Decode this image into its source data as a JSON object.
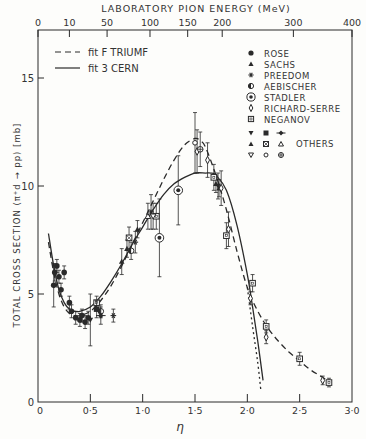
{
  "chart_data": {
    "type": "scatter",
    "title": "",
    "top_axis": {
      "label": "LABORATORY PION ENERGY (MeV)",
      "ticks": [
        {
          "label": "0",
          "eta": 0.0
        },
        {
          "label": "10",
          "eta": 0.3
        },
        {
          "label": "50",
          "eta": 0.66
        },
        {
          "label": "100",
          "eta": 1.07
        },
        {
          "label": "150",
          "eta": 1.43
        },
        {
          "label": "200",
          "eta": 1.76
        },
        {
          "label": "300",
          "eta": 2.44
        },
        {
          "label": "400",
          "eta": 3.0
        }
      ]
    },
    "xlabel": "η",
    "ylabel": "TOTAL CROSS SECTION (π⁺d → pp) [mb]",
    "xlim": [
      0,
      3.0
    ],
    "ylim": [
      0,
      17
    ],
    "xticks": [
      {
        "v": 0,
        "label": "0"
      },
      {
        "v": 0.5,
        "label": "0·5"
      },
      {
        "v": 1.0,
        "label": "1·0"
      },
      {
        "v": 1.5,
        "label": "1·5"
      },
      {
        "v": 2.0,
        "label": "2·0"
      },
      {
        "v": 2.5,
        "label": "2·5"
      },
      {
        "v": 3.0,
        "label": "3·0"
      }
    ],
    "yticks": [
      {
        "v": 0,
        "label": "0"
      },
      {
        "v": 5,
        "label": "5"
      },
      {
        "v": 10,
        "label": "10"
      },
      {
        "v": 15,
        "label": "15"
      }
    ],
    "grid": false,
    "legend_position": "upper-left (fits), upper-right (data)",
    "fits": [
      {
        "name": "fit F TRIUMF",
        "style": "dashed",
        "x": [
          0.1,
          0.15,
          0.2,
          0.25,
          0.3,
          0.35,
          0.4,
          0.5,
          0.6,
          0.7,
          0.8,
          0.9,
          1.0,
          1.1,
          1.2,
          1.3,
          1.4,
          1.5,
          1.55,
          1.6,
          1.7,
          1.8,
          1.9,
          2.0,
          2.1,
          2.2,
          2.3,
          2.4,
          2.5,
          2.6,
          2.7,
          2.8
        ],
        "y": [
          7.4,
          6.0,
          5.0,
          4.4,
          4.1,
          4.0,
          4.0,
          4.2,
          4.7,
          5.4,
          6.3,
          7.3,
          8.3,
          9.3,
          10.3,
          11.2,
          11.9,
          12.2,
          12.1,
          11.8,
          10.5,
          8.9,
          7.0,
          5.3,
          4.2,
          3.4,
          2.8,
          2.3,
          1.9,
          1.5,
          1.2,
          0.9
        ]
      },
      {
        "name": "fit 3 CERN",
        "style": "solid",
        "x": [
          0.1,
          0.15,
          0.2,
          0.25,
          0.3,
          0.35,
          0.4,
          0.5,
          0.6,
          0.7,
          0.8,
          0.9,
          1.0,
          1.1,
          1.2,
          1.3,
          1.4,
          1.5,
          1.6,
          1.65,
          1.7,
          1.8,
          1.9,
          2.0,
          2.05,
          2.1,
          2.15
        ],
        "y": [
          7.8,
          6.3,
          5.2,
          4.6,
          4.3,
          4.2,
          4.2,
          4.4,
          4.9,
          5.6,
          6.4,
          7.3,
          8.1,
          8.9,
          9.6,
          10.1,
          10.4,
          10.6,
          10.6,
          10.6,
          10.5,
          9.8,
          8.2,
          5.9,
          4.4,
          2.8,
          1.0
        ]
      },
      {
        "name": "fit F TRIUMF extrapolation",
        "style": "dotted",
        "x": [
          2.0,
          2.05,
          2.1,
          2.13
        ],
        "y": [
          5.3,
          3.5,
          1.8,
          0.5
        ]
      }
    ],
    "series": [
      {
        "name": "ROSE",
        "marker": "filled-circle",
        "points": [
          [
            0.15,
            5.4,
            1.0
          ],
          [
            0.16,
            6.0,
            0.4
          ],
          [
            0.18,
            6.3,
            0.3
          ],
          [
            0.2,
            5.8,
            0.3
          ],
          [
            0.25,
            6.0,
            0.3
          ],
          [
            0.22,
            5.2,
            0.3
          ],
          [
            0.3,
            4.6,
            0.3
          ],
          [
            0.32,
            4.2,
            0.3
          ],
          [
            0.36,
            3.9,
            0.3
          ],
          [
            0.4,
            3.8,
            0.3
          ],
          [
            0.42,
            4.0,
            0.3
          ],
          [
            0.45,
            3.7,
            0.3
          ],
          [
            0.48,
            3.9,
            0.3
          ]
        ]
      },
      {
        "name": "SACHS",
        "marker": "filled-triangle",
        "points": [
          [
            0.85,
            7.1,
            0.4
          ],
          [
            0.95,
            8.0,
            0.4
          ],
          [
            1.7,
            10.1,
            0.4
          ],
          [
            1.73,
            9.9,
            0.4
          ]
        ]
      },
      {
        "name": "PREEDOM",
        "marker": "asterisk",
        "points": [
          [
            0.72,
            4.0,
            0.3
          ],
          [
            0.93,
            7.4,
            0.5
          ],
          [
            1.08,
            8.8,
            0.8
          ]
        ]
      },
      {
        "name": "AEBISCHER",
        "marker": "half-filled-circle",
        "points": [
          [
            0.6,
            4.2,
            0.3
          ],
          [
            0.89,
            7.0,
            0.4
          ]
        ]
      },
      {
        "name": "STADLER",
        "marker": "circled-dot",
        "points": [
          [
            1.16,
            7.6,
            1.8
          ],
          [
            1.34,
            9.8,
            1.6
          ]
        ]
      },
      {
        "name": "RICHARD-SERRE",
        "marker": "open-diamond",
        "points": [
          [
            1.52,
            11.6,
            1.0
          ],
          [
            1.62,
            11.2,
            0.8
          ],
          [
            1.75,
            9.9,
            0.8
          ],
          [
            1.82,
            8.0,
            0.8
          ],
          [
            2.03,
            4.8,
            0.3
          ],
          [
            2.18,
            3.0,
            0.3
          ],
          [
            2.72,
            1.0,
            0.2
          ]
        ]
      },
      {
        "name": "NEGANOV",
        "marker": "open-square",
        "points": [
          [
            0.56,
            4.6,
            0.3
          ],
          [
            1.13,
            8.6,
            0.6
          ],
          [
            1.68,
            10.4,
            0.6
          ],
          [
            1.8,
            7.7,
            0.6
          ],
          [
            2.05,
            5.5,
            0.4
          ],
          [
            2.18,
            3.5,
            0.3
          ],
          [
            2.5,
            2.0,
            0.3
          ],
          [
            2.78,
            0.9,
            0.2
          ]
        ]
      },
      {
        "name": "OTHERS",
        "marker": "mixed",
        "points": [
          [
            0.5,
            3.8,
            1.2
          ],
          [
            0.56,
            4.3,
            0.4
          ],
          [
            0.6,
            4.0,
            0.4
          ],
          [
            0.8,
            6.5,
            0.6
          ],
          [
            0.87,
            7.6,
            0.5
          ],
          [
            1.05,
            8.6,
            0.6
          ],
          [
            1.1,
            8.6,
            0.6
          ],
          [
            1.5,
            12.0,
            1.4
          ],
          [
            1.55,
            11.7,
            0.8
          ],
          [
            1.72,
            10.0,
            0.6
          ]
        ]
      }
    ]
  },
  "legend": {
    "fits": [
      {
        "label": "fit F TRIUMF",
        "style": "dashed"
      },
      {
        "label": "fit 3 CERN",
        "style": "solid"
      }
    ],
    "data": [
      {
        "label": "ROSE",
        "marker": "filled-circle"
      },
      {
        "label": "SACHS",
        "marker": "filled-triangle"
      },
      {
        "label": "PREEDOM",
        "marker": "asterisk"
      },
      {
        "label": "AEBISCHER",
        "marker": "half-filled-circle"
      },
      {
        "label": "STADLER",
        "marker": "circled-dot"
      },
      {
        "label": "RICHARD-SERRE",
        "marker": "open-diamond"
      },
      {
        "label": "NEGANOV",
        "marker": "open-square"
      }
    ],
    "others_label": "OTHERS"
  }
}
